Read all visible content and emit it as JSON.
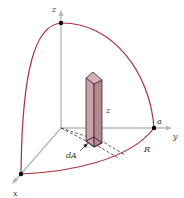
{
  "figure": {
    "colors": {
      "arc": "#a8323a",
      "axis": "#b8b8b8",
      "column_fill": "#c9a0a8",
      "column_side": "#b58890",
      "column_edge": "#3a2a2e",
      "dashed": "#333333",
      "dot": "#000000",
      "text": "#333333"
    },
    "labels": {
      "z_axis": "z",
      "y_axis": "y",
      "x_axis": "x",
      "column_height": "z",
      "radius": "a",
      "region": "R",
      "area_element": "dA"
    }
  }
}
